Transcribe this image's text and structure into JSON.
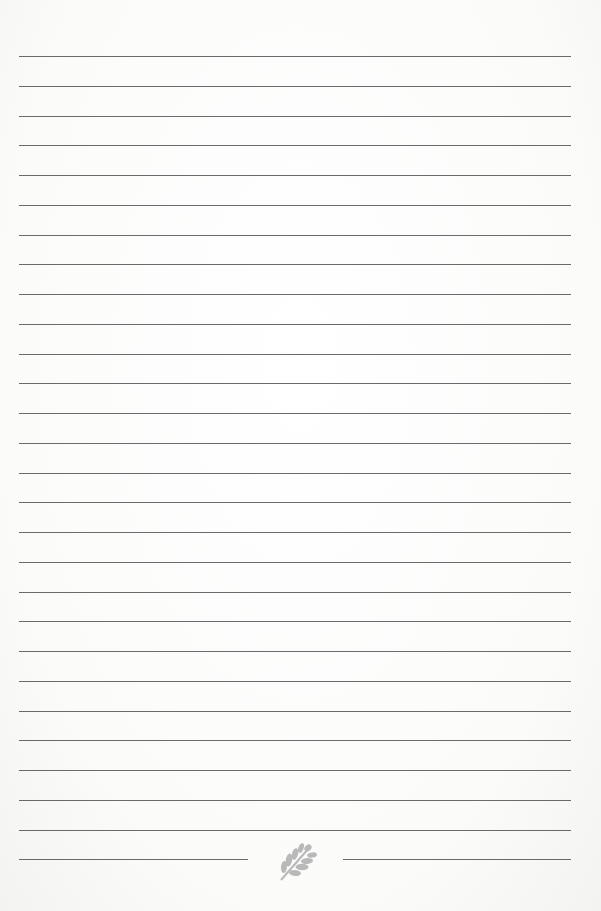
{
  "document": {
    "type": "lined-notepaper",
    "full_rule_count": 27,
    "has_split_final_rule": true,
    "footer_ornament": "leaf-icon",
    "colors": {
      "paper": "#fdfdfc",
      "rule": "#6a6a6a",
      "ornament": "#b9b9b9"
    }
  }
}
